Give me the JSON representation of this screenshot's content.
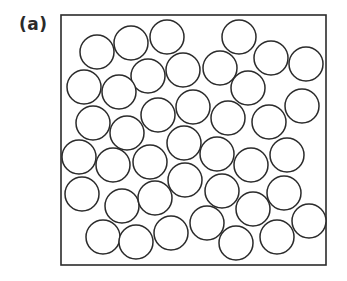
{
  "figure": {
    "label": "(a)",
    "stroke_color": "#2b2b2b",
    "fill_color": "#ffffff",
    "container": {
      "x": 61,
      "y": 15,
      "width": 265,
      "height": 250
    },
    "circle_radius": 17,
    "circles": [
      {
        "cx": 97,
        "cy": 52
      },
      {
        "cx": 131,
        "cy": 43
      },
      {
        "cx": 167,
        "cy": 37
      },
      {
        "cx": 239,
        "cy": 37
      },
      {
        "cx": 271,
        "cy": 58
      },
      {
        "cx": 306,
        "cy": 64
      },
      {
        "cx": 148,
        "cy": 76
      },
      {
        "cx": 183,
        "cy": 70
      },
      {
        "cx": 220,
        "cy": 68
      },
      {
        "cx": 84,
        "cy": 87
      },
      {
        "cx": 119,
        "cy": 92
      },
      {
        "cx": 248,
        "cy": 88
      },
      {
        "cx": 302,
        "cy": 106
      },
      {
        "cx": 93,
        "cy": 123
      },
      {
        "cx": 127,
        "cy": 133
      },
      {
        "cx": 158,
        "cy": 115
      },
      {
        "cx": 193,
        "cy": 107
      },
      {
        "cx": 228,
        "cy": 118
      },
      {
        "cx": 269,
        "cy": 122
      },
      {
        "cx": 184,
        "cy": 143
      },
      {
        "cx": 79,
        "cy": 157
      },
      {
        "cx": 113,
        "cy": 165
      },
      {
        "cx": 150,
        "cy": 162
      },
      {
        "cx": 217,
        "cy": 154
      },
      {
        "cx": 251,
        "cy": 165
      },
      {
        "cx": 287,
        "cy": 155
      },
      {
        "cx": 82,
        "cy": 194
      },
      {
        "cx": 122,
        "cy": 206
      },
      {
        "cx": 155,
        "cy": 198
      },
      {
        "cx": 185,
        "cy": 180
      },
      {
        "cx": 222,
        "cy": 191
      },
      {
        "cx": 253,
        "cy": 209
      },
      {
        "cx": 284,
        "cy": 193
      },
      {
        "cx": 309,
        "cy": 221
      },
      {
        "cx": 103,
        "cy": 237
      },
      {
        "cx": 136,
        "cy": 242
      },
      {
        "cx": 171,
        "cy": 233
      },
      {
        "cx": 207,
        "cy": 223
      },
      {
        "cx": 236,
        "cy": 243
      },
      {
        "cx": 277,
        "cy": 237
      }
    ]
  }
}
